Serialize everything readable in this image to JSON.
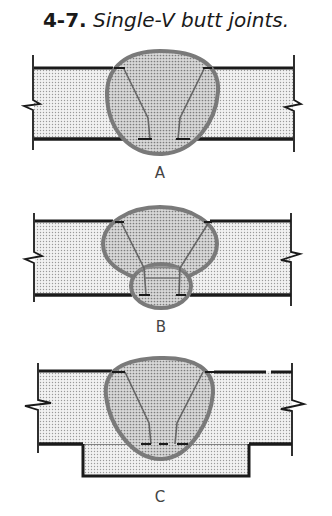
{
  "figure": {
    "number": "4-7.",
    "caption": "Single-V butt joints."
  },
  "panels": [
    {
      "id": "A",
      "label": "A",
      "description": "Single-V butt joint with weld fully penetrating both plates"
    },
    {
      "id": "B",
      "label": "B",
      "description": "Single-V butt joint with back (root) weld pass"
    },
    {
      "id": "C",
      "label": "C",
      "description": "Single-V butt joint with backing strip"
    }
  ],
  "colors": {
    "plate_fill": "#e4e4e4",
    "weld_fill": "#bdbdbd",
    "weld_outline": "#7a7a7a",
    "plate_edge": "#1a1a1a"
  }
}
